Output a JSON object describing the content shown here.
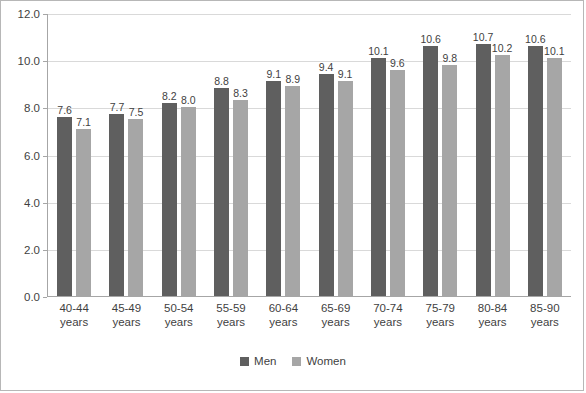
{
  "chart_data": {
    "type": "bar",
    "title": "",
    "xlabel": "",
    "ylabel": "",
    "ylim": [
      0.0,
      12.0
    ],
    "ytick_step": 2.0,
    "grid": true,
    "legend_position": "bottom",
    "categories": [
      "40-44 years",
      "45-49 years",
      "50-54 years",
      "55-59 years",
      "60-64 years",
      "65-69 years",
      "70-74 years",
      "75-79 years",
      "80-84 years",
      "85-90 years"
    ],
    "category_lines": [
      [
        "40-44",
        "years"
      ],
      [
        "45-49",
        "years"
      ],
      [
        "50-54",
        "years"
      ],
      [
        "55-59",
        "years"
      ],
      [
        "60-64",
        "years"
      ],
      [
        "65-69",
        "years"
      ],
      [
        "70-74",
        "years"
      ],
      [
        "75-79",
        "years"
      ],
      [
        "80-84",
        "years"
      ],
      [
        "85-90",
        "years"
      ]
    ],
    "ytick_labels": [
      "0.0",
      "2.0",
      "4.0",
      "6.0",
      "8.0",
      "10.0",
      "12.0"
    ],
    "series": [
      {
        "name": "Men",
        "color": "#5f5f5f",
        "values": [
          7.6,
          7.7,
          8.2,
          8.8,
          9.1,
          9.4,
          10.1,
          10.6,
          10.7,
          10.6
        ],
        "labels": [
          "7.6",
          "7.7",
          "8.2",
          "8.8",
          "9.1",
          "9.4",
          "10.1",
          "10.6",
          "10.7",
          "10.6"
        ]
      },
      {
        "name": "Women",
        "color": "#a6a6a6",
        "values": [
          7.1,
          7.5,
          8.0,
          8.3,
          8.9,
          9.1,
          9.6,
          9.8,
          10.2,
          10.1
        ],
        "labels": [
          "7.1",
          "7.5",
          "8.0",
          "8.3",
          "8.9",
          "9.1",
          "9.6",
          "9.8",
          "10.2",
          "10.1"
        ]
      }
    ]
  }
}
